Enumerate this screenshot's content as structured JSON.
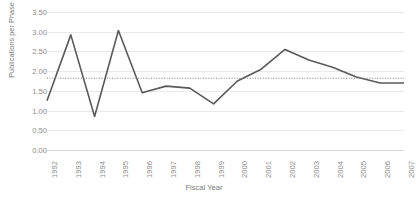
{
  "chart_data": {
    "type": "line",
    "title": "",
    "xlabel": "Fiscal Year",
    "ylabel": "Publications per Phase II DOD Project",
    "categories": [
      "1992",
      "1993",
      "1994",
      "1995",
      "1996",
      "1997",
      "1998",
      "1999",
      "2000",
      "2001",
      "2002",
      "2003",
      "2004",
      "2005",
      "2006",
      "2007"
    ],
    "series": [
      {
        "name": "Publications per Phase II DOD Project",
        "style": "solid",
        "color": "#595959",
        "values": [
          1.25,
          2.92,
          0.85,
          3.03,
          1.45,
          1.62,
          1.57,
          1.17,
          1.75,
          2.05,
          2.55,
          2.28,
          2.1,
          1.85,
          1.7,
          1.7
        ]
      },
      {
        "name": "Trendline (average)",
        "style": "dotted",
        "color": "#808080",
        "values": [
          1.82,
          1.82,
          1.82,
          1.82,
          1.82,
          1.82,
          1.82,
          1.82,
          1.82,
          1.82,
          1.82,
          1.82,
          1.82,
          1.82,
          1.82,
          1.82
        ]
      }
    ],
    "ylim": [
      0.0,
      3.5
    ],
    "ytick_values": [
      3.5,
      3.0,
      2.5,
      2.0,
      1.5,
      1.0,
      0.5,
      0.0
    ],
    "ytick_labels": [
      "3.50",
      "3.00",
      "2.50",
      "2.00",
      "1.50",
      "1.00",
      "0.50",
      "0.00"
    ],
    "grid": "horizontal",
    "legend": "none"
  }
}
